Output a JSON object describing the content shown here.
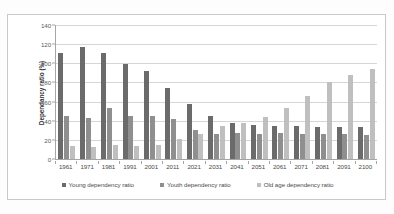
{
  "chart_data": {
    "type": "bar",
    "title": "",
    "subtitle": "",
    "xlabel": "",
    "ylabel": "Dependancy ratio (%)",
    "ylim": [
      0,
      140
    ],
    "ytick_step": 20,
    "yticks": [
      0,
      20,
      40,
      60,
      80,
      100,
      120,
      140
    ],
    "grid": true,
    "legend_position": "bottom",
    "categories": [
      "1961",
      "1971",
      "1981",
      "1991",
      "2001",
      "2011",
      "2021",
      "2031",
      "2041",
      "2051",
      "2061",
      "2071",
      "2081",
      "2091",
      "2100"
    ],
    "series": [
      {
        "name": "Young dependency ratio",
        "color": "#6b6b6b",
        "values": [
          111,
          117,
          111,
          99,
          92,
          74,
          58,
          45,
          38,
          36,
          35,
          34,
          33,
          33,
          33
        ]
      },
      {
        "name": "Youth dependency ratio",
        "color": "#8f8f8f",
        "values": [
          45,
          43,
          53,
          45,
          45,
          42,
          30,
          26,
          27,
          26,
          27,
          26,
          26,
          26,
          25
        ]
      },
      {
        "name": "Old age dependency ratio",
        "color": "#bfbfbf",
        "values": [
          14,
          13,
          15,
          14,
          15,
          21,
          26,
          34,
          38,
          44,
          53,
          66,
          80,
          88,
          94
        ]
      }
    ]
  },
  "axes": {
    "y_title": "Dependancy ratio (%)"
  }
}
